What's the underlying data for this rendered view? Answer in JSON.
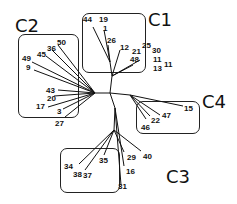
{
  "diagram": {
    "type": "unrooted phylogenetic tree",
    "clusters": [
      {
        "id": "C1",
        "label": "C1",
        "members": [
          "44",
          "19",
          "1",
          "26",
          "12",
          "21",
          "25",
          "30",
          "48",
          "11",
          "13",
          "11"
        ]
      },
      {
        "id": "C2",
        "label": "C2",
        "members": [
          "50",
          "36",
          "45",
          "49",
          "9",
          "43",
          "20",
          "17",
          "3",
          "27"
        ]
      },
      {
        "id": "C3",
        "label": "C3",
        "members": [
          "34",
          "38",
          "37",
          "35",
          "29",
          "40",
          "16",
          "31"
        ]
      },
      {
        "id": "C4",
        "label": "C4",
        "members": [
          "15",
          "47",
          "22",
          "46"
        ]
      }
    ],
    "leaves": [
      {
        "label": "44"
      },
      {
        "label": "19"
      },
      {
        "label": "1"
      },
      {
        "label": "26"
      },
      {
        "label": "12"
      },
      {
        "label": "21"
      },
      {
        "label": "25"
      },
      {
        "label": "30"
      },
      {
        "label": "48"
      },
      {
        "label": "11"
      },
      {
        "label": "13"
      },
      {
        "label": "11"
      },
      {
        "label": "50"
      },
      {
        "label": "36"
      },
      {
        "label": "45"
      },
      {
        "label": "49"
      },
      {
        "label": "9"
      },
      {
        "label": "43"
      },
      {
        "label": "20"
      },
      {
        "label": "17"
      },
      {
        "label": "3"
      },
      {
        "label": "27"
      },
      {
        "label": "15"
      },
      {
        "label": "47"
      },
      {
        "label": "22"
      },
      {
        "label": "46"
      },
      {
        "label": "34"
      },
      {
        "label": "38"
      },
      {
        "label": "37"
      },
      {
        "label": "35"
      },
      {
        "label": "29"
      },
      {
        "label": "40"
      },
      {
        "label": "16"
      },
      {
        "label": "31"
      }
    ],
    "line_color": "#111111"
  }
}
